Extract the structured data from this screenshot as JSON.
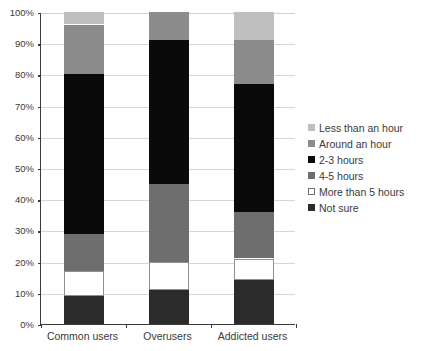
{
  "chart_data": {
    "type": "bar",
    "subtype": "stacked-percentage",
    "title": "",
    "xlabel": "",
    "ylabel": "",
    "ylim": [
      0,
      100
    ],
    "grid": true,
    "legend_position": "right",
    "categories": [
      "Common users",
      "Overusers",
      "Addicted users"
    ],
    "ytick_labels": [
      "0%",
      "10%",
      "20%",
      "30%",
      "40%",
      "50%",
      "60%",
      "70%",
      "80%",
      "90%",
      "100%"
    ],
    "ytick_values": [
      0,
      10,
      20,
      30,
      40,
      50,
      60,
      70,
      80,
      90,
      100
    ],
    "stack_order_bottom_to_top": [
      "Not sure",
      "More than 5 hours",
      "4-5 hours",
      "2-3 hours",
      "Around an hour",
      "Less than an hour"
    ],
    "series": [
      {
        "name": "Less than an hour",
        "color": "#bfbfbf",
        "values": [
          4,
          0,
          9
        ]
      },
      {
        "name": "Around an hour",
        "color": "#8c8c8c",
        "values": [
          16,
          9,
          14
        ]
      },
      {
        "name": "2-3 hours",
        "color": "#0a0a0a",
        "values": [
          51,
          46,
          41
        ]
      },
      {
        "name": "4-5 hours",
        "color": "#6e6e6e",
        "values": [
          12,
          25,
          15
        ]
      },
      {
        "name": "More than 5 hours",
        "color": "#ffffff",
        "values": [
          8,
          9,
          7
        ]
      },
      {
        "name": "Not sure",
        "color": "#2b2b2b",
        "values": [
          9,
          11,
          14
        ]
      }
    ],
    "legend_entries": [
      {
        "label": "Less than an hour",
        "color": "#bfbfbf",
        "outlined": false
      },
      {
        "label": "Around an hour",
        "color": "#8c8c8c",
        "outlined": false
      },
      {
        "label": "2-3 hours",
        "color": "#0a0a0a",
        "outlined": false
      },
      {
        "label": "4-5 hours",
        "color": "#6e6e6e",
        "outlined": false
      },
      {
        "label": "More than 5 hours",
        "color": "#ffffff",
        "outlined": true
      },
      {
        "label": "Not sure",
        "color": "#2b2b2b",
        "outlined": false
      }
    ],
    "stacks": [
      {
        "category": "Common users",
        "segments": [
          {
            "label": "Not sure",
            "value": 9,
            "start": 0,
            "end": 9,
            "color": "#2b2b2b",
            "outlined": false
          },
          {
            "label": "More than 5 hours",
            "value": 8,
            "start": 9,
            "end": 17,
            "color": "#ffffff",
            "outlined": true
          },
          {
            "label": "4-5 hours",
            "value": 12,
            "start": 17,
            "end": 29,
            "color": "#6e6e6e",
            "outlined": false
          },
          {
            "label": "2-3 hours",
            "value": 51,
            "start": 29,
            "end": 80,
            "color": "#0a0a0a",
            "outlined": false
          },
          {
            "label": "Around an hour",
            "value": 16,
            "start": 80,
            "end": 96,
            "color": "#8c8c8c",
            "outlined": false
          },
          {
            "label": "Less than an hour",
            "value": 4,
            "start": 96,
            "end": 100,
            "color": "#bfbfbf",
            "outlined": false
          }
        ]
      },
      {
        "category": "Overusers",
        "segments": [
          {
            "label": "Not sure",
            "value": 11,
            "start": 0,
            "end": 11,
            "color": "#2b2b2b",
            "outlined": false
          },
          {
            "label": "More than 5 hours",
            "value": 9,
            "start": 11,
            "end": 20,
            "color": "#ffffff",
            "outlined": true
          },
          {
            "label": "4-5 hours",
            "value": 25,
            "start": 20,
            "end": 45,
            "color": "#6e6e6e",
            "outlined": false
          },
          {
            "label": "2-3 hours",
            "value": 46,
            "start": 45,
            "end": 91,
            "color": "#0a0a0a",
            "outlined": false
          },
          {
            "label": "Around an hour",
            "value": 9,
            "start": 91,
            "end": 100,
            "color": "#8c8c8c",
            "outlined": false
          }
        ]
      },
      {
        "category": "Addicted users",
        "segments": [
          {
            "label": "Not sure",
            "value": 14,
            "start": 0,
            "end": 14,
            "color": "#2b2b2b",
            "outlined": false
          },
          {
            "label": "More than 5 hours",
            "value": 7,
            "start": 14,
            "end": 21,
            "color": "#ffffff",
            "outlined": true
          },
          {
            "label": "4-5 hours",
            "value": 15,
            "start": 21,
            "end": 36,
            "color": "#6e6e6e",
            "outlined": false
          },
          {
            "label": "2-3 hours",
            "value": 41,
            "start": 36,
            "end": 77,
            "color": "#0a0a0a",
            "outlined": false
          },
          {
            "label": "Around an hour",
            "value": 14,
            "start": 77,
            "end": 91,
            "color": "#8c8c8c",
            "outlined": false
          },
          {
            "label": "Less than an hour",
            "value": 9,
            "start": 91,
            "end": 100,
            "color": "#bfbfbf",
            "outlined": false
          }
        ]
      }
    ]
  }
}
